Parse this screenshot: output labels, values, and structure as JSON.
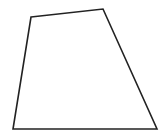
{
  "figure": {
    "shape": "quadrilateral",
    "vertices": [
      {
        "x": 31,
        "y": 17
      },
      {
        "x": 103,
        "y": 9
      },
      {
        "x": 157,
        "y": 129
      },
      {
        "x": 13,
        "y": 129
      }
    ],
    "stroke_color": "#222222",
    "fill_color": "none",
    "background": "#ffffff"
  }
}
